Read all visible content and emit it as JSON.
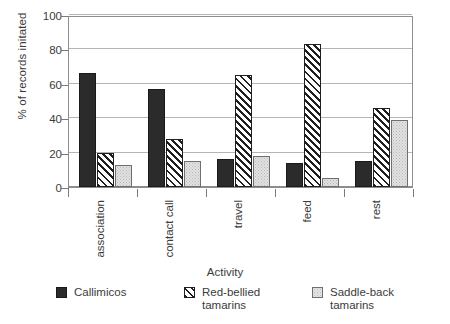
{
  "chart_data": {
    "type": "bar",
    "title": "",
    "xlabel": "Activity",
    "ylabel": "% of records initated",
    "categories": [
      "association",
      "contact call",
      "travel",
      "feed",
      "rest"
    ],
    "series": [
      {
        "name": "Callimicos",
        "pattern": "solid-black",
        "values": [
          66,
          57,
          16,
          14,
          15
        ]
      },
      {
        "name": "Red-bellied\ntamarins",
        "pattern": "diagonal-hatch",
        "values": [
          20,
          28,
          65,
          83,
          46
        ]
      },
      {
        "name": "Saddle-back\ntamarins",
        "pattern": "light-stipple",
        "values": [
          13,
          15,
          18,
          5,
          39
        ]
      }
    ],
    "ylim": [
      0,
      100
    ],
    "yticks": [
      0,
      20,
      40,
      60,
      80,
      100
    ],
    "ytick_labels": [
      "0",
      "20",
      "40",
      "60",
      "80",
      "100"
    ],
    "grid": true,
    "legend_position": "bottom",
    "colors": {
      "series_0": "#2b2b2b",
      "series_1": "#1f1f1f",
      "series_2": "#e2e2e2",
      "gridline": "#b4b4b4",
      "frame": "#8d8d8d",
      "text": "#3b3b3b",
      "background": "#ffffff"
    }
  }
}
